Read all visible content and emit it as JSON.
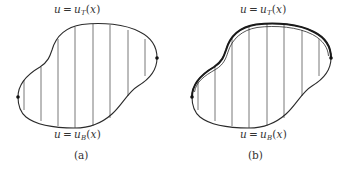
{
  "figure": {
    "panels": [
      {
        "id": "a",
        "caption": "(a)",
        "top_label": {
          "lhs": "u",
          "eq": "=",
          "func": "u",
          "sub": "T",
          "open": "(",
          "arg": "x",
          "close": ")"
        },
        "bottom_label": {
          "lhs": "u",
          "eq": "=",
          "func": "u",
          "sub": "B",
          "open": "(",
          "arg": "x",
          "close": ")"
        },
        "vertical_line_count": 8,
        "boundary_dots": 2,
        "highlighted_top_boundary": false
      },
      {
        "id": "b",
        "caption": "(b)",
        "top_label": {
          "lhs": "u",
          "eq": "=",
          "func": "u",
          "sub": "T",
          "open": "(",
          "arg": "x",
          "close": ")"
        },
        "bottom_label": {
          "lhs": "u",
          "eq": "=",
          "func": "u",
          "sub": "B",
          "open": "(",
          "arg": "x",
          "close": ")"
        },
        "vertical_line_count": 8,
        "boundary_dots": 2,
        "highlighted_top_boundary": true
      }
    ],
    "colors": {
      "stroke": "#2a2a2a",
      "hatch": "#555555",
      "text": "#333333",
      "background": "#ffffff"
    }
  }
}
